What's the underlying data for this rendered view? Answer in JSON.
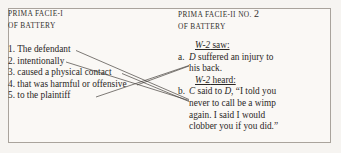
{
  "figure": {
    "background_color": "#f6f4f1",
    "panel_color": "#faf8f5",
    "border_color": "#a9a39c",
    "ink_color": "#2a2725",
    "link_color": "#46423e"
  },
  "left": {
    "header_line1": "PRIMA FACIE-I",
    "header_line2": "OF BATTERY",
    "items": [
      "1. The defendant",
      "2. intentionally",
      "3. caused a physical contact",
      "4. that was harmful or offensive",
      "5. to the plaintiff"
    ]
  },
  "right": {
    "header_line1_prefix": "PRIMA FACIE-II NO.",
    "header_line1_number": "2",
    "header_line2": "OF BATTERY",
    "saw_label_italic": "W-2",
    "saw_label_rest": " saw:",
    "entry_a_mark": "a.",
    "entry_a_italic": "D",
    "entry_a_line1": " suffered an injury to",
    "entry_a_line2": "his back.",
    "heard_label_italic": "W-2",
    "heard_label_rest": " heard:",
    "entry_b_mark": "b.",
    "entry_b_italic_1": "C",
    "entry_b_mid": " said to ",
    "entry_b_italic_2": "D",
    "entry_b_line1_tail": ", “I told you",
    "entry_b_line2": "never to call be a wimp",
    "entry_b_line3": "again. I said I would",
    "entry_b_line4": "clobber you if you did.”"
  },
  "links": [
    {
      "name": "link-item1-to-b",
      "x1": 76,
      "y1": 50.5,
      "x2": 189,
      "y2": 99.5
    },
    {
      "name": "link-item2-to-b",
      "x1": 66,
      "y1": 62,
      "x2": 189,
      "y2": 100.5
    },
    {
      "name": "link-item3-to-b",
      "x1": 122,
      "y1": 73.5,
      "x2": 189,
      "y2": 101.5
    },
    {
      "name": "link-item4-to-a",
      "x1": 137,
      "y1": 85,
      "x2": 189,
      "y2": 66
    },
    {
      "name": "link-item5-to-a",
      "x1": 96,
      "y1": 97,
      "x2": 189,
      "y2": 65.5
    }
  ]
}
